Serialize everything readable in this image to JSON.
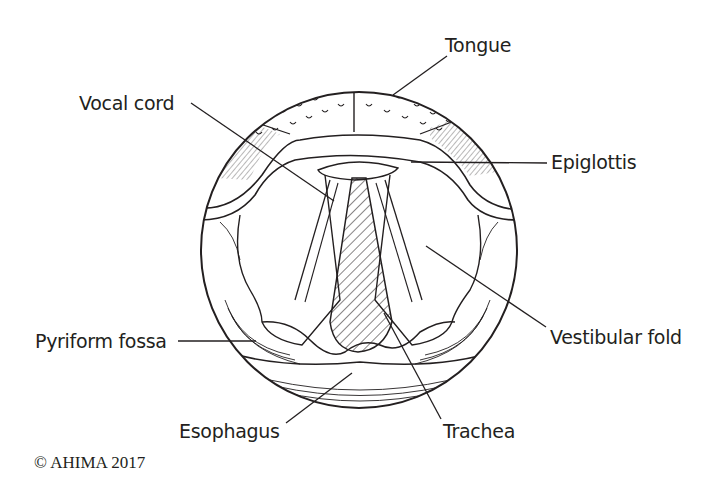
{
  "diagram": {
    "labels": {
      "tongue": "Tongue",
      "vocal_cord": "Vocal cord",
      "epiglottis": "Epiglottis",
      "vestibular_fold": "Vestibular fold",
      "pyriform_fossa": "Pyriform fossa",
      "esophagus": "Esophagus",
      "trachea": "Trachea"
    },
    "copyright": "© AHIMA 2017",
    "colors": {
      "ink": "#231f20",
      "background": "#ffffff"
    }
  }
}
